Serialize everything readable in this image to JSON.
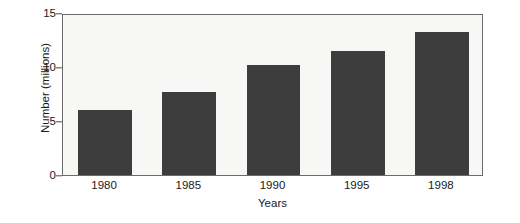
{
  "chart_data": {
    "type": "bar",
    "title": "",
    "subtitle": "",
    "xlabel": "Years",
    "ylabel": "Number (millions)",
    "categories": [
      "1980",
      "1985",
      "1990",
      "1995",
      "1998"
    ],
    "values": [
      6.0,
      7.7,
      10.2,
      11.5,
      13.2
    ],
    "series": [
      {
        "name": "Number (millions)",
        "values": [
          6.0,
          7.7,
          10.2,
          11.5,
          13.2
        ]
      }
    ],
    "ylim": [
      0,
      15
    ],
    "yticks": [
      "0",
      "5",
      "10",
      "15"
    ],
    "ytick_values": [
      0,
      5,
      10,
      15
    ],
    "grid": false,
    "legend": false,
    "legend_position": "none",
    "bar_color": "#3d3d3d",
    "plot_background": "#f7f7f5",
    "axis_color": "#6b6b6b",
    "text_color": "#1a1a1a",
    "annotations": []
  }
}
